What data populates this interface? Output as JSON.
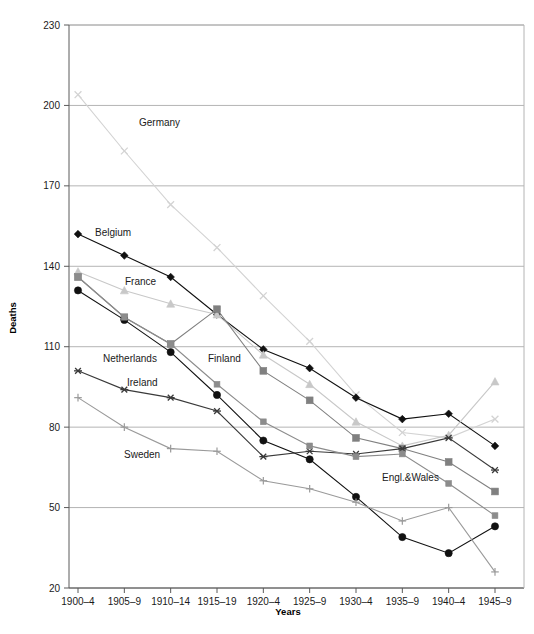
{
  "chart_data": {
    "type": "line",
    "title": "",
    "xlabel": "Years",
    "ylabel": "Deaths",
    "grid": true,
    "legend_position": "inline-labels",
    "ylim": [
      20,
      230
    ],
    "yticks": [
      20,
      50,
      80,
      110,
      140,
      170,
      200,
      230
    ],
    "categories": [
      "1900–4",
      "1905–9",
      "1910–14",
      "1915–19",
      "1920–4",
      "1925–9",
      "1930–4",
      "1935–9",
      "1940–4",
      "1945–9"
    ],
    "series": [
      {
        "name": "Germany",
        "marker": "x",
        "color": "#d3d3d3",
        "values": [
          204,
          183,
          163,
          147,
          129,
          112,
          92,
          78,
          76,
          83
        ]
      },
      {
        "name": "Belgium",
        "marker": "diamond",
        "color": "#111111",
        "values": [
          152,
          144,
          136,
          122,
          109,
          102,
          91,
          83,
          85,
          73
        ]
      },
      {
        "name": "France",
        "marker": "triangle",
        "color": "#c8c8c8",
        "values": [
          138,
          131,
          126,
          122,
          107,
          96,
          82,
          73,
          77,
          97
        ]
      },
      {
        "name": "Finland",
        "marker": "square",
        "color": "#808080",
        "values": [
          136,
          121,
          111,
          124,
          101,
          90,
          76,
          72,
          67,
          56
        ]
      },
      {
        "name": "Netherlands",
        "marker": "circle",
        "color": "#111111",
        "values": [
          131,
          120,
          108,
          92,
          75,
          68,
          54,
          39,
          33,
          43
        ]
      },
      {
        "name": "Ireland",
        "marker": "star",
        "color": "#3a3a3a",
        "values": [
          101,
          94,
          91,
          86,
          69,
          71,
          70,
          72,
          76,
          64
        ]
      },
      {
        "name": "Engl.&Wales",
        "marker": "square-small",
        "color": "#8c8c8c",
        "values": [
          136,
          121,
          111,
          96,
          82,
          73,
          69,
          70,
          59,
          47
        ]
      },
      {
        "name": "Sweden",
        "marker": "plus",
        "color": "#9a9a9a",
        "values": [
          91,
          80,
          72,
          71,
          60,
          57,
          52,
          45,
          50,
          26
        ]
      }
    ],
    "annotations": [
      {
        "text": "Germany",
        "x": 139,
        "y": 126
      },
      {
        "text": "Belgium",
        "x": 95,
        "y": 236
      },
      {
        "text": "France",
        "x": 125,
        "y": 285
      },
      {
        "text": "Netherlands",
        "x": 103,
        "y": 362
      },
      {
        "text": "Finland",
        "x": 208,
        "y": 362
      },
      {
        "text": "Ireland",
        "x": 127,
        "y": 386
      },
      {
        "text": "Sweden",
        "x": 124,
        "y": 458
      },
      {
        "text": "Engl.&Wales",
        "x": 382,
        "y": 481
      }
    ]
  },
  "axes": {
    "y_title": "Deaths",
    "x_title": "Years"
  }
}
